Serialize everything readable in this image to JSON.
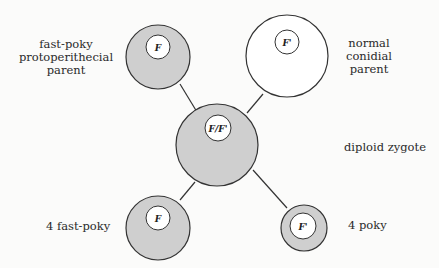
{
  "diagram": {
    "type": "genetic-cross",
    "colors": {
      "shaded": "#cfcfcf",
      "outline": "#333333",
      "background": "#fbfbfa",
      "unshaded": "#ffffff"
    },
    "nodes": [
      {
        "id": "fast-poky-parent",
        "label_lines": [
          "fast-poky",
          "protoperithecial",
          "parent"
        ],
        "gene": "F",
        "shaded": true
      },
      {
        "id": "normal-parent",
        "label_lines": [
          "normal",
          "conidial",
          "parent"
        ],
        "gene": "F'",
        "shaded": false
      },
      {
        "id": "diploid-zygote",
        "label_lines": [
          "diploid zygote"
        ],
        "gene": "F/F'",
        "shaded": true
      },
      {
        "id": "fast-poky-progeny",
        "label_lines": [
          "4 fast-poky"
        ],
        "gene": "F",
        "shaded": true
      },
      {
        "id": "poky-progeny",
        "label_lines": [
          "4 poky"
        ],
        "gene": "F'",
        "shaded": true
      }
    ],
    "edges": [
      {
        "from": "fast-poky-parent",
        "to": "diploid-zygote"
      },
      {
        "from": "normal-parent",
        "to": "diploid-zygote"
      },
      {
        "from": "diploid-zygote",
        "to": "fast-poky-progeny"
      },
      {
        "from": "diploid-zygote",
        "to": "poky-progeny"
      }
    ]
  },
  "labels": {
    "fast_poky_parent": [
      "fast-poky",
      "protoperithecial",
      "parent"
    ],
    "normal_parent": [
      "normal",
      "conidial",
      "parent"
    ],
    "zygote": "diploid zygote",
    "fast_poky_progeny": "4 fast-poky",
    "poky_progeny": "4 poky"
  },
  "genes": {
    "fast_poky_parent": "F",
    "normal_parent": "F'",
    "zygote": "F/F'",
    "fast_poky_progeny": "F",
    "poky_progeny": "F'"
  }
}
